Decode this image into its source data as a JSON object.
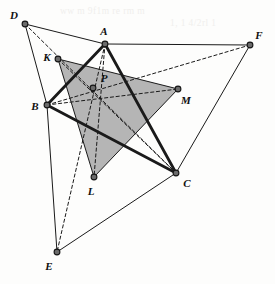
{
  "figure": {
    "width": 275,
    "height": 284,
    "background_color": "#fdfdfc",
    "shaded_fill_color": "#a8a8a8",
    "shaded_fill_opacity": 0.85,
    "stroke_color": "#1a1a1a",
    "vertex_dot_color": "#6b6b6b",
    "vertex_dot_stroke": "#151515"
  },
  "points": [
    {
      "id": "A",
      "label": "A",
      "x": 105,
      "y": 44,
      "label_x": 104,
      "label_y": 31
    },
    {
      "id": "B",
      "label": "B",
      "x": 47,
      "y": 105,
      "label_x": 35,
      "label_y": 106
    },
    {
      "id": "C",
      "label": "C",
      "x": 176,
      "y": 173,
      "label_x": 187,
      "label_y": 183
    },
    {
      "id": "D",
      "label": "D",
      "x": 25,
      "y": 24,
      "label_x": 14,
      "label_y": 15
    },
    {
      "id": "E",
      "label": "E",
      "x": 57,
      "y": 252,
      "label_x": 49,
      "label_y": 266
    },
    {
      "id": "F",
      "label": "F",
      "x": 250,
      "y": 45,
      "label_x": 259,
      "label_y": 35
    },
    {
      "id": "K",
      "label": "K",
      "x": 58,
      "y": 59,
      "label_x": 47,
      "label_y": 57
    },
    {
      "id": "L",
      "label": "L",
      "x": 94,
      "y": 177,
      "label_x": 91,
      "label_y": 191
    },
    {
      "id": "M",
      "label": "M",
      "x": 178,
      "y": 89,
      "label_x": 186,
      "label_y": 100
    },
    {
      "id": "P",
      "label": "P",
      "x": 93,
      "y": 88,
      "label_x": 104,
      "label_y": 78
    }
  ],
  "shaded_polygon": {
    "name": "triangle-KLM",
    "vertices": [
      "K",
      "L",
      "M"
    ]
  },
  "edges": [
    {
      "name": "edge-A-B",
      "from": "A",
      "to": "B",
      "style": "solid",
      "weight": "thick"
    },
    {
      "name": "edge-B-C",
      "from": "B",
      "to": "C",
      "style": "solid",
      "weight": "thick"
    },
    {
      "name": "edge-A-C",
      "from": "A",
      "to": "C",
      "style": "solid",
      "weight": "thick"
    },
    {
      "name": "edge-D-A",
      "from": "D",
      "to": "A",
      "style": "solid",
      "weight": "thin"
    },
    {
      "name": "edge-A-F",
      "from": "A",
      "to": "F",
      "style": "solid",
      "weight": "thin"
    },
    {
      "name": "edge-F-C",
      "from": "F",
      "to": "C",
      "style": "solid",
      "weight": "thin"
    },
    {
      "name": "edge-C-E",
      "from": "C",
      "to": "E",
      "style": "solid",
      "weight": "thin"
    },
    {
      "name": "edge-E-B",
      "from": "E",
      "to": "B",
      "style": "solid",
      "weight": "thin"
    },
    {
      "name": "edge-B-D",
      "from": "B",
      "to": "D",
      "style": "solid",
      "weight": "thin"
    },
    {
      "name": "edge-K-L",
      "from": "K",
      "to": "L",
      "style": "solid",
      "weight": "thin"
    },
    {
      "name": "edge-L-M",
      "from": "L",
      "to": "M",
      "style": "solid",
      "weight": "thin"
    },
    {
      "name": "edge-M-K",
      "from": "M",
      "to": "K",
      "style": "solid",
      "weight": "thin"
    },
    {
      "name": "edge-D-K-C",
      "from": "D",
      "to": "C",
      "style": "dashed",
      "weight": "thin"
    },
    {
      "name": "edge-A-P-L-E",
      "from": "A",
      "to": "E",
      "style": "dashed",
      "weight": "thin"
    },
    {
      "name": "edge-B-P-M-F",
      "from": "B",
      "to": "F",
      "style": "dashed",
      "weight": "thin"
    },
    {
      "name": "edge-K-P-C",
      "from": "K",
      "to": "C",
      "style": "dashed",
      "weight": "thin"
    },
    {
      "name": "edge-A-P-L",
      "from": "A",
      "to": "L",
      "style": "dashed",
      "weight": "thin"
    },
    {
      "name": "edge-B-P-M",
      "from": "B",
      "to": "M",
      "style": "dashed",
      "weight": "thin"
    }
  ],
  "bleed_through": [
    {
      "text": "ww m   9f1m re rm m",
      "x": 60,
      "y": 6
    },
    {
      "text": "1, 1 4/2rl 1",
      "x": 170,
      "y": 18
    }
  ]
}
